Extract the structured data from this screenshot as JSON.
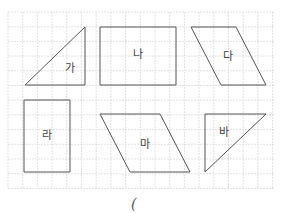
{
  "grid": {
    "x0": 8,
    "y0": 12,
    "x1": 274,
    "y1": 188,
    "spacing": 14.7,
    "line_color": "#d6d6d6",
    "stroke_color": "#555555"
  },
  "shapes": [
    {
      "label": "가",
      "type": "right-triangle",
      "points": "25,85 85,27 85,85",
      "label_x": 70,
      "label_y": 72
    },
    {
      "label": "나",
      "type": "rectangle",
      "points": "100,27 176,27 176,85 100,85",
      "label_x": 138,
      "label_y": 58
    },
    {
      "label": "다",
      "type": "parallelogram",
      "points": "191,27 236,27 266,85 221,85",
      "label_x": 228,
      "label_y": 60
    },
    {
      "label": "라",
      "type": "rectangle",
      "points": "24,100 70,100 70,172 24,172",
      "label_x": 47,
      "label_y": 139
    },
    {
      "label": "마",
      "type": "parallelogram",
      "points": "100,114 160,114 190,172 130,172",
      "label_x": 145,
      "label_y": 148
    },
    {
      "label": "바",
      "type": "right-triangle",
      "points": "205,114 266,114 205,172",
      "label_x": 224,
      "label_y": 136
    }
  ],
  "answer": {
    "open_paren": "("
  }
}
